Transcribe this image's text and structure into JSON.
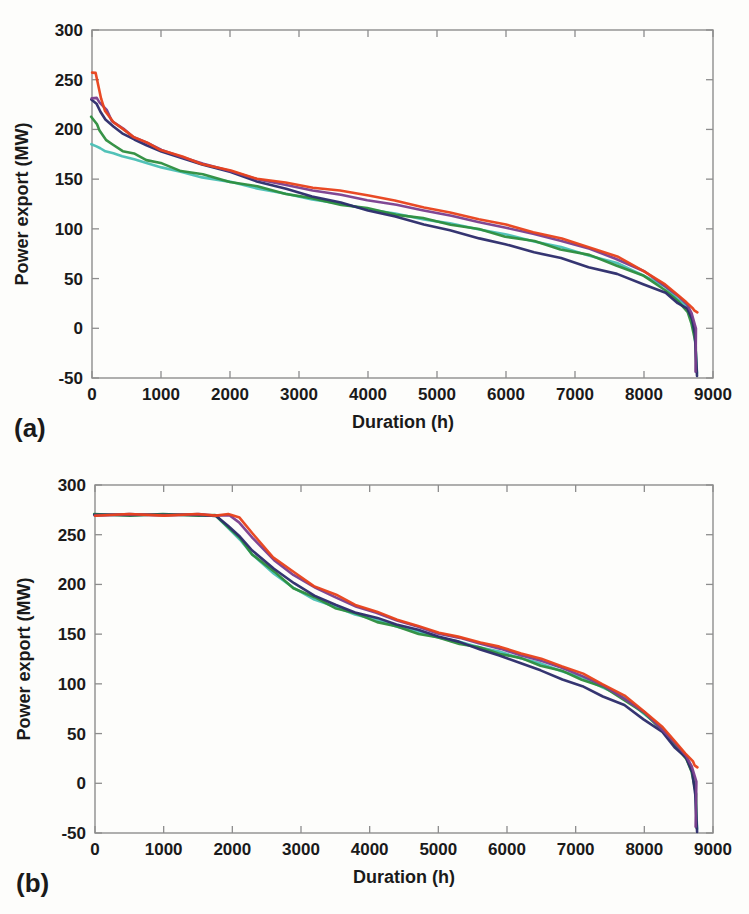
{
  "figure": {
    "background_color": "#fdfdfb",
    "frame_color": "#8d8d8d",
    "text_color": "#1a1a1a"
  },
  "panels": [
    {
      "id": "a",
      "label": "(a)",
      "xlabel": "Duration (h)",
      "ylabel": "Power export (MW)"
    },
    {
      "id": "b",
      "label": "(b)",
      "xlabel": "Duration (h)",
      "ylabel": "Power export (MW)"
    }
  ],
  "axis": {
    "x_ticks": [
      "0",
      "1000",
      "2000",
      "3000",
      "4000",
      "5000",
      "6000",
      "7000",
      "8000",
      "9000"
    ],
    "y_ticks": [
      "300",
      "250",
      "200",
      "150",
      "100",
      "50",
      "0",
      "-50"
    ]
  },
  "series_colors": {
    "red": "#e8431c",
    "purple": "#7b3f8f",
    "green": "#2f8f3f",
    "cyan": "#4bbfb5",
    "navy": "#2d2d6b"
  },
  "chart_data": [
    {
      "type": "line",
      "id": "a",
      "title": "(a) Power export duration curve without constraint",
      "xlabel": "Duration (h)",
      "ylabel": "Power export (MW)",
      "xlim": [
        0,
        9000
      ],
      "ylim": [
        -50,
        300
      ],
      "xticks": [
        0,
        1000,
        2000,
        3000,
        4000,
        5000,
        6000,
        7000,
        8000,
        9000
      ],
      "yticks": [
        -50,
        0,
        50,
        100,
        150,
        200,
        250,
        300
      ],
      "grid": false,
      "legend": "none",
      "x": [
        0,
        60,
        120,
        200,
        300,
        450,
        600,
        800,
        1000,
        1300,
        1600,
        2000,
        2400,
        2800,
        3200,
        3600,
        4000,
        4400,
        4800,
        5200,
        5600,
        6000,
        6400,
        6800,
        7200,
        7600,
        8000,
        8300,
        8500,
        8620,
        8700,
        8740,
        8760
      ],
      "series": [
        {
          "name": "red",
          "color": "#e8431c",
          "values": [
            258,
            256,
            232,
            218,
            208,
            200,
            193,
            186,
            180,
            172,
            166,
            158,
            151,
            146,
            142,
            138,
            134,
            128,
            122,
            116,
            110,
            104,
            97,
            90,
            82,
            72,
            58,
            44,
            33,
            26,
            20,
            18,
            16
          ]
        },
        {
          "name": "purple",
          "color": "#7b3f8f",
          "values": [
            232,
            231,
            228,
            219,
            209,
            200,
            193,
            186,
            180,
            172,
            166,
            158,
            150,
            144,
            139,
            134,
            129,
            124,
            119,
            113,
            107,
            101,
            95,
            88,
            80,
            70,
            57,
            43,
            32,
            24,
            15,
            0,
            -44
          ]
        },
        {
          "name": "green",
          "color": "#2f8f3f",
          "values": [
            212,
            206,
            198,
            190,
            184,
            179,
            175,
            170,
            165,
            159,
            154,
            148,
            142,
            136,
            130,
            125,
            120,
            115,
            110,
            105,
            99,
            93,
            87,
            80,
            73,
            64,
            52,
            39,
            27,
            17,
            4,
            -14,
            -44
          ]
        },
        {
          "name": "cyan",
          "color": "#4bbfb5",
          "values": [
            185,
            183,
            181,
            178,
            176,
            173,
            170,
            166,
            162,
            157,
            152,
            147,
            141,
            135,
            130,
            125,
            120,
            115,
            110,
            105,
            100,
            94,
            88,
            81,
            74,
            65,
            54,
            41,
            30,
            21,
            9,
            -8,
            -44
          ]
        },
        {
          "name": "navy",
          "color": "#2d2d6b",
          "values": [
            230,
            226,
            218,
            210,
            203,
            196,
            190,
            184,
            178,
            171,
            165,
            157,
            148,
            140,
            133,
            126,
            119,
            112,
            105,
            98,
            91,
            84,
            77,
            70,
            62,
            54,
            45,
            35,
            26,
            19,
            10,
            -6,
            -47
          ]
        }
      ]
    },
    {
      "type": "line",
      "id": "b",
      "title": "(b) Power export duration curve with 270 MW cap",
      "xlabel": "Duration (h)",
      "ylabel": "Power export (MW)",
      "xlim": [
        0,
        9000
      ],
      "ylim": [
        -50,
        300
      ],
      "xticks": [
        0,
        1000,
        2000,
        3000,
        4000,
        5000,
        6000,
        7000,
        8000,
        9000
      ],
      "yticks": [
        -50,
        0,
        50,
        100,
        150,
        200,
        250,
        300
      ],
      "grid": false,
      "legend": "none",
      "plateau_value": 270,
      "x": [
        0,
        500,
        1000,
        1500,
        1750,
        1950,
        2100,
        2300,
        2600,
        2900,
        3200,
        3500,
        3800,
        4100,
        4400,
        4700,
        5000,
        5300,
        5600,
        5900,
        6200,
        6500,
        6800,
        7100,
        7400,
        7700,
        8000,
        8250,
        8450,
        8600,
        8700,
        8745,
        8760
      ],
      "series": [
        {
          "name": "red",
          "color": "#e8431c",
          "values": [
            270,
            270,
            270,
            270,
            270,
            270,
            268,
            250,
            228,
            211,
            199,
            189,
            180,
            172,
            165,
            158,
            152,
            147,
            142,
            137,
            131,
            125,
            118,
            110,
            100,
            88,
            73,
            57,
            42,
            30,
            22,
            18,
            16
          ]
        },
        {
          "name": "purple",
          "color": "#7b3f8f",
          "values": [
            270,
            270,
            270,
            270,
            270,
            269,
            263,
            246,
            225,
            209,
            197,
            187,
            178,
            171,
            164,
            157,
            151,
            146,
            141,
            135,
            129,
            123,
            116,
            108,
            98,
            86,
            71,
            55,
            40,
            28,
            17,
            2,
            -44
          ]
        },
        {
          "name": "green",
          "color": "#2f8f3f",
          "values": [
            270,
            270,
            270,
            270,
            269,
            258,
            246,
            231,
            212,
            197,
            186,
            177,
            170,
            163,
            157,
            151,
            146,
            141,
            136,
            131,
            125,
            119,
            112,
            105,
            96,
            85,
            70,
            54,
            38,
            25,
            11,
            -10,
            -45
          ]
        },
        {
          "name": "cyan",
          "color": "#4bbfb5",
          "values": [
            270,
            270,
            270,
            270,
            269,
            257,
            245,
            230,
            211,
            196,
            185,
            177,
            170,
            164,
            158,
            152,
            147,
            142,
            137,
            132,
            126,
            120,
            113,
            106,
            97,
            86,
            71,
            55,
            39,
            27,
            14,
            -6,
            -45
          ]
        },
        {
          "name": "navy",
          "color": "#2d2d6b",
          "values": [
            270,
            270,
            270,
            270,
            269,
            259,
            248,
            234,
            216,
            201,
            189,
            179,
            172,
            166,
            160,
            154,
            148,
            142,
            135,
            128,
            121,
            113,
            105,
            97,
            88,
            78,
            65,
            51,
            37,
            25,
            12,
            -12,
            -48
          ]
        }
      ]
    }
  ]
}
